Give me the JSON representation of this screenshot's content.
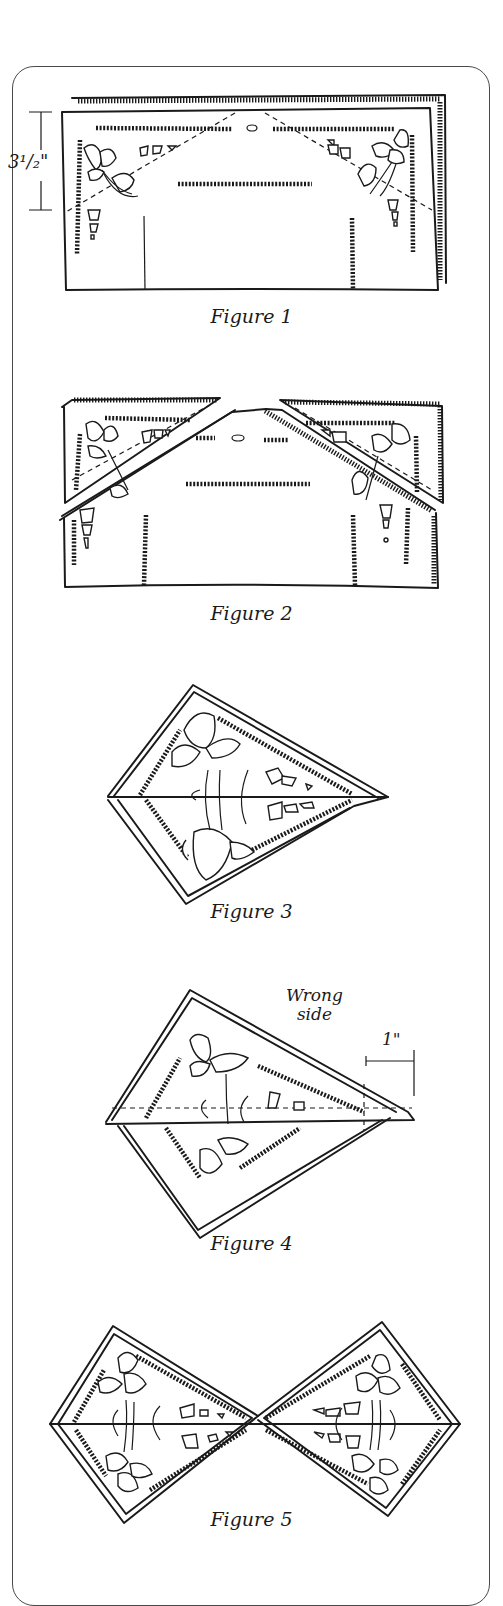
{
  "page": {
    "type": "napkin folding instruction diagram",
    "figures": [
      {
        "id": 1,
        "caption": "Figure 1",
        "annotations": [
          {
            "text": "3¹/₂\"",
            "meaning": "fold depth measurement"
          }
        ],
        "description": "Rectangle folded napkin with dashed fold lines from top center to side corners"
      },
      {
        "id": 2,
        "caption": "Figure 2",
        "annotations": [],
        "description": "Top corners folded down diagonally toward center"
      },
      {
        "id": 3,
        "caption": "Figure 3",
        "annotations": [],
        "description": "Kite shape with center horizontal line"
      },
      {
        "id": 4,
        "caption": "Figure 4",
        "annotations": [
          {
            "text": "Wrong side",
            "line1": "Wrong",
            "line2": "side"
          },
          {
            "text": "1\"",
            "meaning": "one inch measurement"
          }
        ],
        "description": "Kite flipped to wrong side, dashed fold line, 1 inch marker at tip"
      },
      {
        "id": 5,
        "caption": "Figure 5",
        "annotations": [],
        "description": "Completed bow-tie shape with two mirrored kites"
      }
    ]
  },
  "fig1": {
    "caption": "Figure 1",
    "measure": "3¹/₂\""
  },
  "fig2": {
    "caption": "Figure 2"
  },
  "fig3": {
    "caption": "Figure 3"
  },
  "fig4": {
    "caption": "Figure 4",
    "wrong_line1": "Wrong",
    "wrong_line2": "side",
    "measure": "1\""
  },
  "fig5": {
    "caption": "Figure 5"
  },
  "colors": {
    "ink": "#1a1a1a",
    "paper": "#ffffff",
    "frame": "#4a4a4a"
  }
}
